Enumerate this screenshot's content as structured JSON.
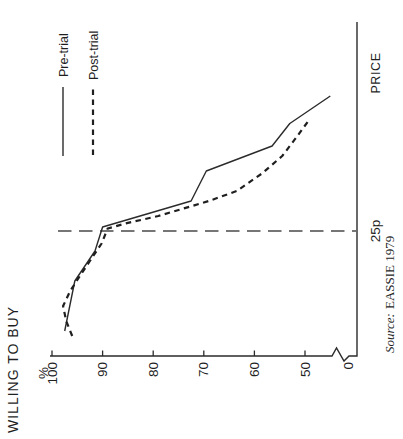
{
  "figure": {
    "rotation": "90-degrees-counter-clockwise",
    "background": "#ffffff",
    "line_color": "#2b2b2b"
  },
  "chart_data": {
    "type": "line",
    "title": "",
    "xlabel": "PRICE",
    "ylabel": "WILLING TO BUY",
    "y_unit": "%",
    "y_ticks": [
      100,
      90,
      80,
      70,
      60,
      50
    ],
    "y_zero_label": "0",
    "y_axis_break": true,
    "ylim": [
      0,
      100
    ],
    "xlim_pence": [
      0,
      67
    ],
    "grid": "off",
    "legend_position": "top-right",
    "x_reference": {
      "price": 25,
      "label": "25p"
    },
    "series": [
      {
        "name": "Pre-trial",
        "line_style": "solid",
        "points": [
          [
            5,
            97.5
          ],
          [
            15,
            95.5
          ],
          [
            21,
            91.5
          ],
          [
            25.8,
            90
          ],
          [
            31,
            72.5
          ],
          [
            37,
            69.5
          ],
          [
            42,
            56.5
          ],
          [
            46.5,
            53
          ],
          [
            52,
            45
          ]
        ]
      },
      {
        "name": "Post-trial",
        "line_style": "dashed",
        "points": [
          [
            4,
            96
          ],
          [
            7,
            97.2
          ],
          [
            10,
            97.8
          ],
          [
            13,
            96.4
          ],
          [
            16,
            94.5
          ],
          [
            19,
            92.5
          ],
          [
            22.5,
            90.2
          ],
          [
            25.5,
            89
          ],
          [
            26.5,
            85.5
          ],
          [
            28,
            79
          ],
          [
            29.5,
            74
          ],
          [
            31,
            69
          ],
          [
            33,
            63.5
          ],
          [
            36.5,
            58.5
          ],
          [
            40,
            54.5
          ],
          [
            44,
            51.5
          ],
          [
            47.5,
            49
          ]
        ]
      }
    ],
    "source_prefix": "Source:",
    "source": "EASSIE 1979"
  }
}
